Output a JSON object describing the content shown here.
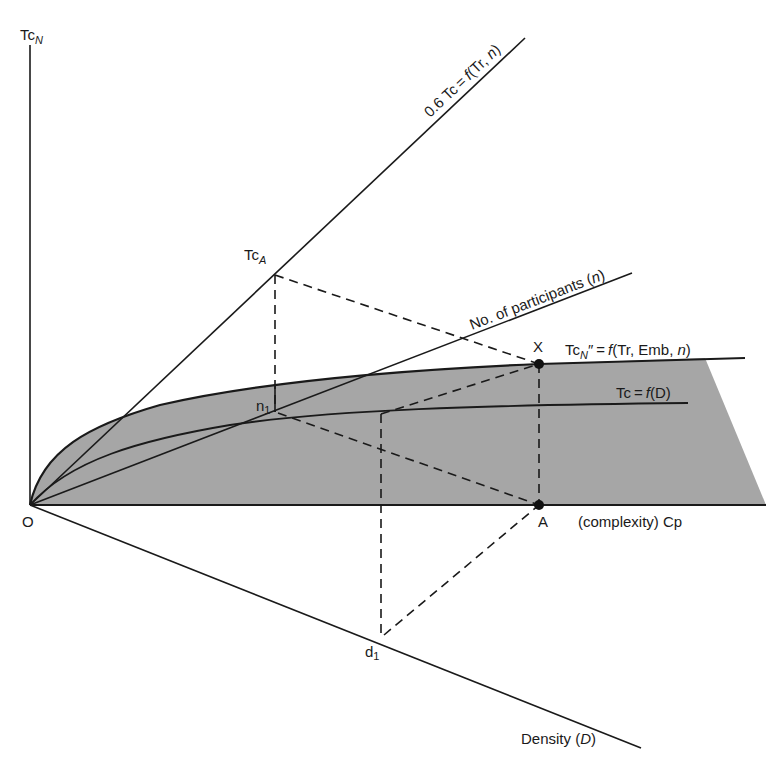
{
  "diagram": {
    "type": "conceptual-geometric-diagram",
    "colors": {
      "shaded_region": "#a6a6a6",
      "line": "#1a1a1a",
      "background": "#ffffff"
    },
    "axes": {
      "vertical": {
        "label_main": "Tc",
        "label_sub": "N"
      },
      "horizontal": {
        "label": "(complexity) Cp"
      },
      "diagonal_down": {
        "label_main": "Density (",
        "label_var": "D",
        "label_close": ")"
      },
      "origin": {
        "label": "O"
      }
    },
    "lines": {
      "steep": {
        "label_prefix": "0.6 Tc = ",
        "label_f": "f",
        "label_args": "(Tr, ",
        "label_n": "n",
        "label_close": ")"
      },
      "participants": {
        "label_prefix": "No. of participants (",
        "label_n": "n",
        "label_close": ")"
      },
      "tcn_curve": {
        "label_main": "Tc",
        "label_sub": "N",
        "label_rest": "″ = ",
        "label_f": "f",
        "label_args": "(Tr, Emb, ",
        "label_n": "n",
        "label_close": ")"
      },
      "tc_density_curve": {
        "label_prefix": "Tc = ",
        "label_f": "f",
        "label_args": "(D)"
      }
    },
    "points": {
      "tc_a": {
        "label_main": "Tc",
        "label_sub": "A"
      },
      "x": {
        "label": "X"
      },
      "a": {
        "label": "A"
      },
      "n1": {
        "label_main": "n",
        "label_sub": "1"
      },
      "d1": {
        "label_main": "d",
        "label_sub": "1"
      }
    }
  }
}
